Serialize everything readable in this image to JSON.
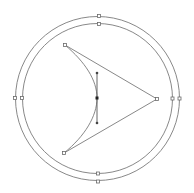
{
  "canvas": {
    "description": "Vector editor canvas with selected shapes",
    "colors": {
      "background": "#ffffff",
      "stroke": "#7a7a7a",
      "handle_fill": "#ffffff",
      "handle_stroke": "#6a6a6a",
      "anchor_fill": "#222222"
    }
  },
  "shapes": [
    {
      "name": "outer-circle",
      "type": "circle",
      "selected": true,
      "handles": [
        "top",
        "right",
        "bottom",
        "left"
      ]
    },
    {
      "name": "inner-circle",
      "type": "circle",
      "selected": true,
      "handles": [
        "top",
        "right",
        "bottom",
        "left"
      ]
    },
    {
      "name": "curved-triangle",
      "type": "path",
      "selected": true,
      "vertices": [
        "top-left",
        "right",
        "bottom-left"
      ],
      "curved_edge": "left",
      "anchor_with_control_handles": true
    }
  ]
}
